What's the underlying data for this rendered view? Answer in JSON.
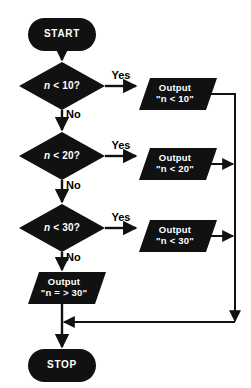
{
  "diagram": {
    "type": "flowchart",
    "colors": {
      "shape_fill": "#111111",
      "shape_text": "#ffffff",
      "connector": "#111111",
      "background": "#ffffff",
      "edge_label_text": "#000000"
    },
    "nodes": [
      {
        "id": "start",
        "shape": "terminal",
        "label": "START"
      },
      {
        "id": "dec1",
        "shape": "decision",
        "label": "n < 10?",
        "var": "n",
        "condition": "< 10?"
      },
      {
        "id": "out1",
        "shape": "parallelogram",
        "line1": "Output",
        "line2": "\"n < 10\""
      },
      {
        "id": "dec2",
        "shape": "decision",
        "label": "n < 20?",
        "var": "n",
        "condition": "< 20?"
      },
      {
        "id": "out2",
        "shape": "parallelogram",
        "line1": "Output",
        "line2": "\"n < 20\""
      },
      {
        "id": "dec3",
        "shape": "decision",
        "label": "n < 30?",
        "var": "n",
        "condition": "< 30?"
      },
      {
        "id": "out3",
        "shape": "parallelogram",
        "line1": "Output",
        "line2": "\"n < 30\""
      },
      {
        "id": "out4",
        "shape": "parallelogram",
        "line1": "Output",
        "line2": "\"n = > 30\""
      },
      {
        "id": "stop",
        "shape": "terminal",
        "label": "STOP"
      }
    ],
    "edge_labels": {
      "yes1": "Yes",
      "no1": "No",
      "yes2": "Yes",
      "no2": "No",
      "yes3": "Yes",
      "no3": "No"
    }
  }
}
